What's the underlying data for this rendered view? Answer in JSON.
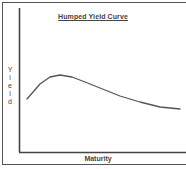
{
  "chart_data": {
    "type": "line",
    "title": "Humped Yield Curve",
    "xlabel": "Maturity",
    "ylabel": "Yield",
    "grid": false,
    "legend": null,
    "x_ticks": [],
    "y_ticks": [],
    "series": [
      {
        "name": "Yield",
        "shape": "humped",
        "points_px": [
          [
            27,
            99
          ],
          [
            40,
            84
          ],
          [
            50,
            77
          ],
          [
            60,
            75
          ],
          [
            72,
            77
          ],
          [
            85,
            82
          ],
          [
            100,
            88
          ],
          [
            120,
            96
          ],
          [
            140,
            102
          ],
          [
            160,
            107
          ],
          [
            180,
            109
          ]
        ]
      }
    ]
  },
  "labels": {
    "title": "Humped Yield Curve",
    "xlabel": "Maturity",
    "ylabel_letters": [
      "Y",
      "i",
      "e",
      "l",
      "d"
    ]
  },
  "colors": {
    "axis": "#444444",
    "curve": "#555555",
    "frame": "#555555"
  }
}
